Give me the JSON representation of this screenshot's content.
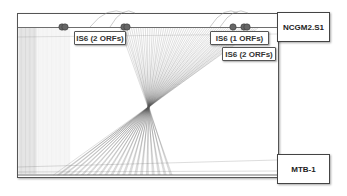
{
  "genomes": {
    "top": {
      "name": "NCGM2.S1"
    },
    "bottom": {
      "name": "MTB-1"
    }
  },
  "annotations": [
    {
      "label": "IS6 (2 ORFs)"
    },
    {
      "label": "IS6 (1 ORFs)"
    },
    {
      "label": "IS6 (2 ORFs)"
    }
  ],
  "colors": {
    "link_lines": "#555555",
    "marker": "#666666",
    "border": "#555555"
  }
}
